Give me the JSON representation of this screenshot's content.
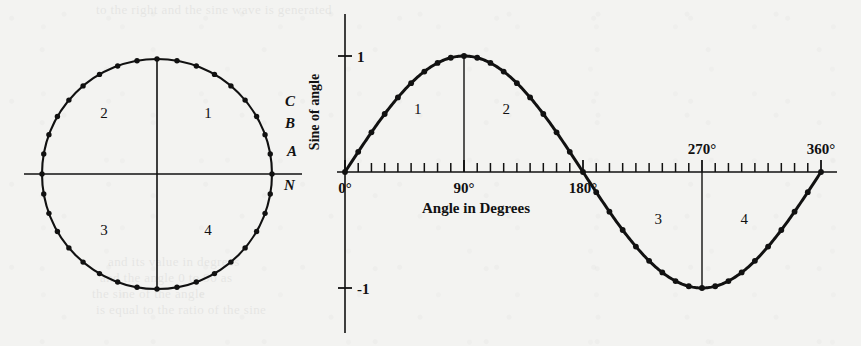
{
  "figure": {
    "background_color": "#f3f3f1",
    "ink_color": "#111111",
    "ghost_text": [
      {
        "text": "to the right and the sine wave is  generated",
        "x": 96,
        "y": 2,
        "size": 13
      },
      {
        "text": "and its value in degrees",
        "x": 108,
        "y": 254,
        "size": 13
      },
      {
        "text": "and the angle   0  to   90   as",
        "x": 100,
        "y": 270,
        "size": 13
      },
      {
        "text": "the sine of the angle",
        "x": 92,
        "y": 286,
        "size": 13
      },
      {
        "text": "is equal to the ratio of the sine",
        "x": 96,
        "y": 302,
        "size": 13
      }
    ]
  },
  "circle_diagram": {
    "name": "unit-circle",
    "center_x": 157,
    "center_y": 174,
    "radius": 115,
    "point_count": 36,
    "point_step_degrees": 10,
    "quadrant_labels": [
      {
        "label": "1",
        "x": 208,
        "y": 118
      },
      {
        "label": "2",
        "x": 104,
        "y": 118
      },
      {
        "label": "3",
        "x": 104,
        "y": 235
      },
      {
        "label": "4",
        "x": 208,
        "y": 235
      }
    ],
    "marked_points": [
      {
        "label": "A",
        "angle_degrees": 10,
        "x": 287,
        "y": 156
      },
      {
        "label": "B",
        "angle_degrees": 20,
        "x": 285,
        "y": 128
      },
      {
        "label": "C",
        "angle_degrees": 30,
        "x": 285,
        "y": 106
      },
      {
        "label": "N",
        "angle_degrees": 0,
        "x": 284,
        "y": 190
      }
    ]
  },
  "chart_data": {
    "type": "line",
    "title": "",
    "xlabel": "Angle in Degrees",
    "ylabel": "Sine of angle",
    "x": [
      0,
      10,
      20,
      30,
      40,
      50,
      60,
      70,
      80,
      90,
      100,
      110,
      120,
      130,
      140,
      150,
      160,
      170,
      180,
      190,
      200,
      210,
      220,
      230,
      240,
      250,
      260,
      270,
      280,
      290,
      300,
      310,
      320,
      330,
      340,
      350,
      360
    ],
    "values": [
      0,
      0.174,
      0.342,
      0.5,
      0.643,
      0.766,
      0.866,
      0.94,
      0.985,
      1,
      0.985,
      0.94,
      0.866,
      0.766,
      0.643,
      0.5,
      0.342,
      0.174,
      0,
      -0.174,
      -0.342,
      -0.5,
      -0.643,
      -0.766,
      -0.866,
      -0.94,
      -0.985,
      -1,
      -0.985,
      -0.94,
      -0.866,
      -0.766,
      -0.643,
      -0.5,
      -0.342,
      -0.174,
      0
    ],
    "xlim": [
      0,
      360
    ],
    "ylim": [
      -1,
      1
    ],
    "x_tick_step": 10,
    "x_tick_labels": [
      "0°",
      "90°",
      "180°",
      "270°",
      "360°"
    ],
    "x_tick_label_values": [
      0,
      90,
      180,
      270,
      360
    ],
    "y_tick_labels": [
      "1",
      "-1"
    ],
    "y_tick_values": [
      1,
      -1
    ],
    "grid": false,
    "legend": "none",
    "markers": true,
    "marker_step_degrees": 10,
    "quadrant_labels": [
      {
        "label": "1",
        "x_degrees": 55,
        "y": 0.5
      },
      {
        "label": "2",
        "x_degrees": 122,
        "y": 0.5
      },
      {
        "label": "3",
        "x_degrees": 237,
        "y": -0.45
      },
      {
        "label": "4",
        "x_degrees": 302,
        "y": -0.45
      }
    ],
    "annotations": [
      {
        "name": "vertical-line-90",
        "x_degrees": 90,
        "from_y": 0,
        "to_y": 1
      },
      {
        "name": "vertical-line-270",
        "x_degrees": 270,
        "from_y": 0,
        "to_y": -1
      }
    ]
  }
}
